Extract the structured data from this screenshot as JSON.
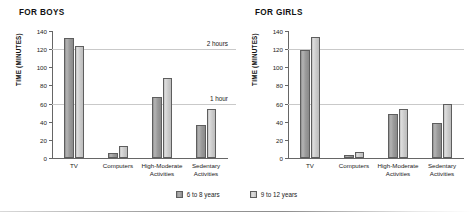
{
  "figure": {
    "legend": {
      "items": [
        {
          "label": "6 to 8 years",
          "color": "#9a9a9a"
        },
        {
          "label": "9 to 12 years",
          "color": "#cccccc"
        }
      ]
    }
  },
  "chart_data": [
    {
      "type": "bar",
      "title": "FOR BOYS",
      "xlabel": "",
      "ylabel": "TIME (MINUTES)",
      "categories": [
        "TV",
        "Computers",
        "High-Moderate\nActivities",
        "Sedentary\nActivities"
      ],
      "series": [
        {
          "name": "6 to 8 years",
          "values": [
            132,
            6,
            67,
            36
          ]
        },
        {
          "name": "9 to 12 years",
          "values": [
            124,
            13,
            88,
            54
          ]
        }
      ],
      "ylim": [
        0,
        140
      ],
      "yticks": [
        0,
        20,
        40,
        60,
        80,
        100,
        120,
        140
      ],
      "grid": true,
      "gridlines": [
        {
          "value": 120,
          "label": "2 hours"
        },
        {
          "value": 60,
          "label": "1 hour"
        }
      ],
      "legend_position": "bottom"
    },
    {
      "type": "bar",
      "title": "FOR GIRLS",
      "xlabel": "",
      "ylabel": "TIME (MINUTES)",
      "categories": [
        "TV",
        "Computers",
        "High-Moderate\nActivities",
        "Sedentary\nActivities"
      ],
      "series": [
        {
          "name": "6 to 8 years",
          "values": [
            119,
            3,
            49,
            39
          ]
        },
        {
          "name": "9 to 12 years",
          "values": [
            133,
            7,
            54,
            59
          ]
        }
      ],
      "ylim": [
        0,
        140
      ],
      "yticks": [
        0,
        20,
        40,
        60,
        80,
        100,
        120,
        140
      ],
      "grid": true,
      "gridlines": [
        {
          "value": 120,
          "label": ""
        },
        {
          "value": 60,
          "label": ""
        }
      ],
      "legend_position": "bottom"
    }
  ]
}
